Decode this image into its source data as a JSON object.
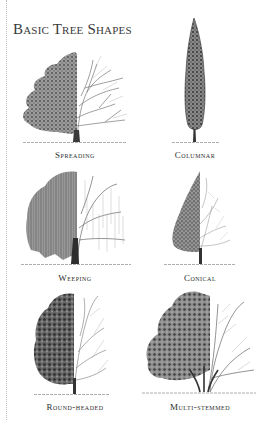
{
  "title": "Basic Tree Shapes",
  "colors": {
    "foliage_dark": "#3c3c3c",
    "foliage_mid": "#777777",
    "branch": "#5a5a5a",
    "branch_light": "#a8a8a8",
    "ground": "#9a9a9a",
    "text": "#2e2e2e"
  },
  "trees": [
    {
      "id": "spreading",
      "label": "Spreading"
    },
    {
      "id": "columnar",
      "label": "Columnar"
    },
    {
      "id": "weeping",
      "label": "Weeping"
    },
    {
      "id": "conical",
      "label": "Conical"
    },
    {
      "id": "round-headed",
      "label": "Round-headed"
    },
    {
      "id": "multi-stemmed",
      "label": "Multi-stemmed"
    }
  ]
}
